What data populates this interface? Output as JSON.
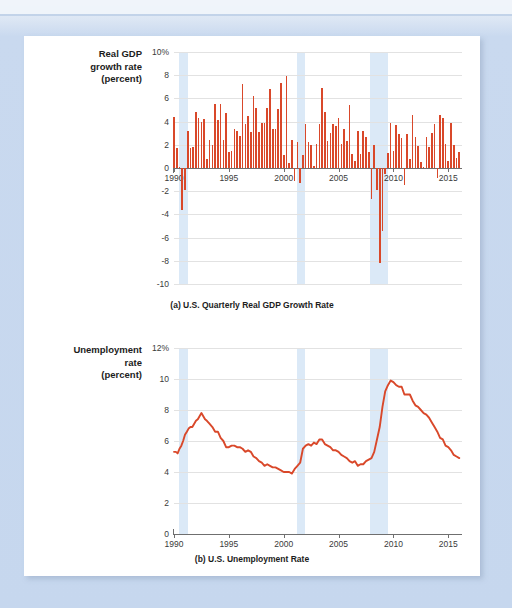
{
  "page": {
    "background_color": "#c6d7ee",
    "card_color": "#ffffff",
    "accent_color": "#d9482a",
    "recession_band_color": "#dbe9f7"
  },
  "chart_data": [
    {
      "type": "bar",
      "id": "gdp",
      "title": "",
      "caption": "(a) U.S. Quarterly Real GDP Growth Rate",
      "ylabel_lines": [
        "Real GDP",
        "growth rate",
        "(percent)"
      ],
      "xlabel": "",
      "ylim": [
        -10,
        10
      ],
      "xlim": [
        1990,
        2016.25
      ],
      "yticks": [
        10,
        8,
        6,
        4,
        2,
        0,
        -2,
        -4,
        -6,
        -8,
        -10
      ],
      "ytick_labels": [
        "10%",
        "8",
        "6",
        "4",
        "2",
        "0",
        "-2",
        "-4",
        "-6",
        "-8",
        "-10"
      ],
      "xticks": [
        1990,
        1995,
        2000,
        2005,
        2010,
        2015
      ],
      "xtick_labels": [
        "1990",
        "1995",
        "2000",
        "2005",
        "2010",
        "2015"
      ],
      "grid": true,
      "legend": "none",
      "series_color": "#d9482a",
      "recession_bands": [
        {
          "start": 1990.5,
          "end": 1991.25
        },
        {
          "start": 2001.25,
          "end": 2001.9
        },
        {
          "start": 2007.9,
          "end": 2009.5
        }
      ],
      "x": [
        1990.0,
        1990.25,
        1990.5,
        1990.75,
        1991.0,
        1991.25,
        1991.5,
        1991.75,
        1992.0,
        1992.25,
        1992.5,
        1992.75,
        1993.0,
        1993.25,
        1993.5,
        1993.75,
        1994.0,
        1994.25,
        1994.5,
        1994.75,
        1995.0,
        1995.25,
        1995.5,
        1995.75,
        1996.0,
        1996.25,
        1996.5,
        1996.75,
        1997.0,
        1997.25,
        1997.5,
        1997.75,
        1998.0,
        1998.25,
        1998.5,
        1998.75,
        1999.0,
        1999.25,
        1999.5,
        1999.75,
        2000.0,
        2000.25,
        2000.5,
        2000.75,
        2001.0,
        2001.25,
        2001.5,
        2001.75,
        2002.0,
        2002.25,
        2002.5,
        2002.75,
        2003.0,
        2003.25,
        2003.5,
        2003.75,
        2004.0,
        2004.25,
        2004.5,
        2004.75,
        2005.0,
        2005.25,
        2005.5,
        2005.75,
        2006.0,
        2006.25,
        2006.5,
        2006.75,
        2007.0,
        2007.25,
        2007.5,
        2007.75,
        2008.0,
        2008.25,
        2008.5,
        2008.75,
        2009.0,
        2009.25,
        2009.5,
        2009.75,
        2010.0,
        2010.25,
        2010.5,
        2010.75,
        2011.0,
        2011.25,
        2011.5,
        2011.75,
        2012.0,
        2012.25,
        2012.5,
        2012.75,
        2013.0,
        2013.25,
        2013.5,
        2013.75,
        2014.0,
        2014.25,
        2014.5,
        2014.75,
        2015.0,
        2015.25,
        2015.5,
        2015.75,
        2016.0
      ],
      "values": [
        4.4,
        1.7,
        0.1,
        -3.6,
        -1.9,
        3.2,
        1.7,
        1.8,
        4.8,
        4.3,
        4.0,
        4.2,
        0.8,
        2.4,
        2.0,
        5.5,
        4.1,
        5.5,
        2.4,
        4.7,
        1.4,
        1.5,
        3.4,
        3.2,
        2.8,
        7.2,
        3.8,
        4.5,
        3.1,
        6.2,
        5.2,
        3.1,
        3.9,
        3.9,
        5.2,
        6.8,
        3.4,
        3.4,
        5.1,
        7.3,
        1.1,
        7.9,
        0.4,
        2.4,
        -1.1,
        2.2,
        -1.3,
        1.1,
        3.8,
        2.2,
        2.0,
        0.2,
        2.1,
        3.8,
        6.9,
        4.8,
        2.3,
        3.0,
        3.8,
        3.6,
        4.3,
        2.1,
        3.4,
        2.3,
        5.4,
        1.2,
        0.6,
        3.2,
        1.2,
        3.2,
        2.7,
        1.4,
        -2.7,
        2.0,
        -1.9,
        -8.2,
        -5.4,
        -0.5,
        1.3,
        3.9,
        1.5,
        3.7,
        2.9,
        2.6,
        -1.5,
        2.9,
        0.8,
        4.6,
        2.7,
        1.9,
        0.5,
        0.1,
        2.7,
        1.8,
        3.0,
        3.8,
        -0.9,
        4.6,
        4.3,
        2.1,
        0.6,
        3.9,
        2.0,
        0.9,
        1.4
      ]
    },
    {
      "type": "line",
      "id": "unemployment",
      "title": "",
      "caption": "(b) U.S. Unemployment Rate",
      "ylabel_lines": [
        "Unemployment",
        "rate",
        "(percent)"
      ],
      "xlabel": "",
      "ylim": [
        0,
        12
      ],
      "xlim": [
        1990,
        2016.25
      ],
      "yticks": [
        12,
        10,
        8,
        6,
        4,
        2,
        0
      ],
      "ytick_labels": [
        "12%",
        "10",
        "8",
        "6",
        "4",
        "2",
        "0"
      ],
      "xticks": [
        1990,
        1995,
        2000,
        2005,
        2010,
        2015
      ],
      "xtick_labels": [
        "1990",
        "1995",
        "2000",
        "2005",
        "2010",
        "2015"
      ],
      "grid": true,
      "legend": "none",
      "series_color": "#d9482a",
      "recession_bands": [
        {
          "start": 1990.5,
          "end": 1991.25
        },
        {
          "start": 2001.25,
          "end": 2001.9
        },
        {
          "start": 2007.9,
          "end": 2009.5
        }
      ],
      "x": [
        1990.0,
        1990.17,
        1990.33,
        1990.5,
        1990.67,
        1990.83,
        1991.0,
        1991.17,
        1991.33,
        1991.5,
        1991.67,
        1991.83,
        1992.0,
        1992.17,
        1992.33,
        1992.5,
        1992.67,
        1992.83,
        1993.0,
        1993.25,
        1993.5,
        1993.75,
        1994.0,
        1994.25,
        1994.5,
        1994.75,
        1995.0,
        1995.25,
        1995.5,
        1995.75,
        1996.0,
        1996.25,
        1996.5,
        1996.75,
        1997.0,
        1997.25,
        1997.5,
        1997.75,
        1998.0,
        1998.25,
        1998.5,
        1998.75,
        1999.0,
        1999.25,
        1999.5,
        1999.75,
        2000.0,
        2000.25,
        2000.5,
        2000.75,
        2001.0,
        2001.25,
        2001.5,
        2001.75,
        2002.0,
        2002.25,
        2002.5,
        2002.75,
        2003.0,
        2003.25,
        2003.5,
        2003.75,
        2004.0,
        2004.25,
        2004.5,
        2004.75,
        2005.0,
        2005.25,
        2005.5,
        2005.75,
        2006.0,
        2006.25,
        2006.5,
        2006.75,
        2007.0,
        2007.25,
        2007.5,
        2007.75,
        2008.0,
        2008.25,
        2008.5,
        2008.75,
        2009.0,
        2009.25,
        2009.5,
        2009.75,
        2010.0,
        2010.25,
        2010.5,
        2010.75,
        2011.0,
        2011.25,
        2011.5,
        2011.75,
        2012.0,
        2012.25,
        2012.5,
        2012.75,
        2013.0,
        2013.25,
        2013.5,
        2013.75,
        2014.0,
        2014.25,
        2014.5,
        2014.75,
        2015.0,
        2015.25,
        2015.5,
        2015.75,
        2016.0
      ],
      "values": [
        5.3,
        5.3,
        5.2,
        5.5,
        5.7,
        6.0,
        6.4,
        6.6,
        6.8,
        6.9,
        6.9,
        7.1,
        7.3,
        7.4,
        7.6,
        7.8,
        7.6,
        7.4,
        7.3,
        7.1,
        6.9,
        6.6,
        6.6,
        6.2,
        6.0,
        5.6,
        5.6,
        5.7,
        5.7,
        5.6,
        5.6,
        5.5,
        5.3,
        5.4,
        5.3,
        5.0,
        4.9,
        4.7,
        4.6,
        4.4,
        4.5,
        4.4,
        4.3,
        4.3,
        4.2,
        4.1,
        4.0,
        4.0,
        4.0,
        3.9,
        4.2,
        4.4,
        4.6,
        5.5,
        5.7,
        5.8,
        5.7,
        5.9,
        5.8,
        6.1,
        6.1,
        5.8,
        5.7,
        5.6,
        5.4,
        5.4,
        5.3,
        5.1,
        5.0,
        4.9,
        4.7,
        4.6,
        4.7,
        4.4,
        4.5,
        4.5,
        4.7,
        4.8,
        4.9,
        5.3,
        6.1,
        6.9,
        8.2,
        9.2,
        9.6,
        9.9,
        9.8,
        9.6,
        9.5,
        9.5,
        9.0,
        9.0,
        9.0,
        8.6,
        8.3,
        8.2,
        8.0,
        7.8,
        7.7,
        7.5,
        7.2,
        6.9,
        6.6,
        6.2,
        6.1,
        5.7,
        5.6,
        5.4,
        5.1,
        5.0,
        4.9
      ]
    }
  ]
}
